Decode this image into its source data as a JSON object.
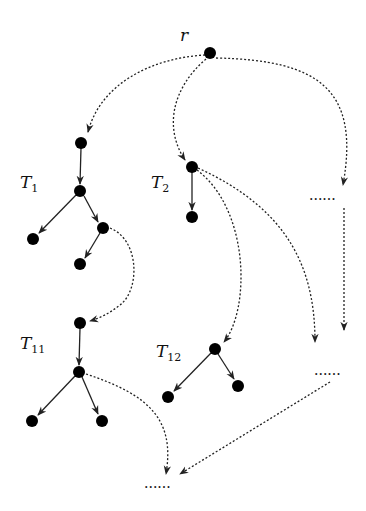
{
  "diagram": {
    "type": "tree-decomposition",
    "root_label": "r",
    "subtree_labels": {
      "t1": {
        "base": "T",
        "sub": "1"
      },
      "t2": {
        "base": "T",
        "sub": "2"
      },
      "t11": {
        "base": "T",
        "sub": "11"
      },
      "t12": {
        "base": "T",
        "sub": "12"
      }
    },
    "ellipsis": "......",
    "colors": {
      "node": "#000000",
      "edge": "#222222",
      "background": "#ffffff"
    },
    "nodes": [
      {
        "id": "r",
        "x": 210,
        "y": 53
      },
      {
        "id": "t1_a",
        "x": 81,
        "y": 143
      },
      {
        "id": "t1_b",
        "x": 80,
        "y": 191
      },
      {
        "id": "t1_c",
        "x": 33,
        "y": 239
      },
      {
        "id": "t1_d",
        "x": 103,
        "y": 228
      },
      {
        "id": "t1_e",
        "x": 80,
        "y": 264
      },
      {
        "id": "t2_a",
        "x": 192,
        "y": 167
      },
      {
        "id": "t2_b",
        "x": 192,
        "y": 217
      },
      {
        "id": "t11_a",
        "x": 80,
        "y": 323
      },
      {
        "id": "t11_b",
        "x": 79,
        "y": 372
      },
      {
        "id": "t11_c",
        "x": 32,
        "y": 421
      },
      {
        "id": "t11_d",
        "x": 102,
        "y": 421
      },
      {
        "id": "t12_a",
        "x": 215,
        "y": 349
      },
      {
        "id": "t12_b",
        "x": 168,
        "y": 397
      },
      {
        "id": "t12_c",
        "x": 238,
        "y": 386
      }
    ],
    "edges_solid": [
      [
        "t1_a",
        "t1_b"
      ],
      [
        "t1_b",
        "t1_c"
      ],
      [
        "t1_b",
        "t1_d"
      ],
      [
        "t1_d",
        "t1_e"
      ],
      [
        "t2_a",
        "t2_b"
      ],
      [
        "t11_a",
        "t11_b"
      ],
      [
        "t11_b",
        "t11_c"
      ],
      [
        "t11_b",
        "t11_d"
      ],
      [
        "t12_a",
        "t12_b"
      ],
      [
        "t12_a",
        "t12_c"
      ]
    ],
    "edges_dotted": [
      [
        "r",
        "t1_a"
      ],
      [
        "r",
        "t2_a"
      ],
      [
        "r",
        "ellipsis_right_top"
      ],
      [
        "t1_d",
        "t11_a"
      ],
      [
        "t2_a",
        "t12_a"
      ],
      [
        "t2_a",
        "ellipsis_right_mid"
      ],
      [
        "ellipsis_right_top",
        "ellipsis_right_mid"
      ],
      [
        "t11_b",
        "ellipsis_bottom"
      ],
      [
        "ellipsis_right_mid",
        "ellipsis_bottom"
      ]
    ]
  }
}
